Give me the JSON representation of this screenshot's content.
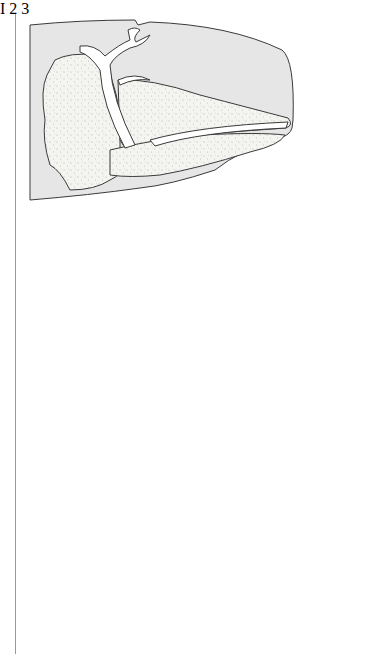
{
  "figure": {
    "panels": [
      {
        "label": "I",
        "description": "Sperm whale head cross-section"
      },
      {
        "label": "2",
        "description": "Head with long nasal passage and toothed lower jaw"
      },
      {
        "label": "3",
        "description": "Head with skull, nasal passages and toothed lower jaw"
      }
    ]
  },
  "colors": {
    "outer_fill": "#e6e6e6",
    "stipple_fill": "#f3f3f0",
    "stroke": "#3a3a3a",
    "passage_fill": "#ffffff"
  }
}
